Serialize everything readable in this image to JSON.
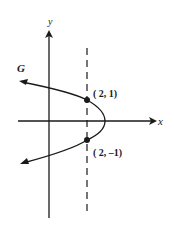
{
  "figure": {
    "curve_label": "G",
    "x_axis_label": "x",
    "y_axis_label": "y",
    "points": [
      {
        "label": "( 2, 1)",
        "x": 2,
        "y": 1
      },
      {
        "label": "( 2, –1)",
        "x": 2,
        "y": -1
      }
    ],
    "dashed_line": "x = 2",
    "curve_type": "sideways parabola opening left",
    "colors": {
      "ink": "#1a1a1a",
      "background": "#ffffff"
    }
  }
}
